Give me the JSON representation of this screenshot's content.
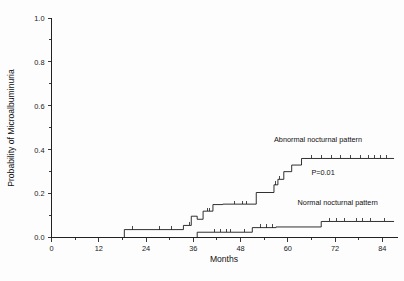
{
  "chart_data": {
    "type": "line",
    "title": "",
    "xlabel": "Months",
    "ylabel": "Probability of Microalbuminuria",
    "xlim": [
      0,
      88
    ],
    "ylim": [
      0,
      1.0
    ],
    "grid": false,
    "legend_position": "inline-above-curve",
    "x_ticks": [
      0,
      12,
      24,
      36,
      48,
      60,
      72,
      84
    ],
    "x_tick_labels": [
      "0",
      "12",
      "24",
      "36",
      "48",
      "60",
      "72",
      "84"
    ],
    "x_minor_ticks": [
      6,
      18,
      30,
      42,
      54,
      66,
      78
    ],
    "y_ticks": [
      0.0,
      0.2,
      0.4,
      0.6,
      0.8,
      1.0
    ],
    "y_tick_labels": [
      "0.0",
      "0.2",
      "0.4",
      "0.6",
      "0.8",
      "1.0"
    ],
    "y_minor_ticks": [
      0.1,
      0.3,
      0.5,
      0.7,
      0.9
    ],
    "annotations": [
      {
        "name": "p-value",
        "text": "P=0.01",
        "x": 66.0,
        "y": 0.285
      }
    ],
    "series": [
      {
        "name": "Abnormal nocturnal pattern",
        "label": "Abnormal nocturnal pattern",
        "label_x": 56.5,
        "label_y": 0.435,
        "steps": [
          [
            18.5,
            0.0
          ],
          [
            18.5,
            0.036
          ],
          [
            33.5,
            0.036
          ],
          [
            33.5,
            0.055
          ],
          [
            35.5,
            0.055
          ],
          [
            35.5,
            0.097
          ],
          [
            37.0,
            0.097
          ],
          [
            37.0,
            0.083
          ],
          [
            38.5,
            0.083
          ],
          [
            38.5,
            0.12
          ],
          [
            41.0,
            0.12
          ],
          [
            41.0,
            0.15
          ],
          [
            43.5,
            0.15
          ],
          [
            43.5,
            0.152
          ],
          [
            52.0,
            0.152
          ],
          [
            52.0,
            0.205
          ],
          [
            56.5,
            0.205
          ],
          [
            56.5,
            0.24
          ],
          [
            57.5,
            0.24
          ],
          [
            57.5,
            0.265
          ],
          [
            59.0,
            0.265
          ],
          [
            59.0,
            0.3
          ],
          [
            61.0,
            0.3
          ],
          [
            61.0,
            0.33
          ],
          [
            63.5,
            0.33
          ],
          [
            63.5,
            0.36
          ],
          [
            87.0,
            0.36
          ]
        ],
        "censor_points": [
          [
            20.5,
            0.036
          ],
          [
            27.5,
            0.036
          ],
          [
            30.5,
            0.036
          ],
          [
            35.0,
            0.055
          ],
          [
            39.5,
            0.12
          ],
          [
            40.0,
            0.12
          ],
          [
            46.5,
            0.152
          ],
          [
            48.5,
            0.152
          ],
          [
            49.5,
            0.152
          ],
          [
            57.0,
            0.24
          ],
          [
            58.0,
            0.265
          ],
          [
            66.0,
            0.36
          ],
          [
            68.5,
            0.36
          ],
          [
            71.0,
            0.36
          ],
          [
            73.5,
            0.36
          ],
          [
            76.0,
            0.36
          ],
          [
            78.5,
            0.36
          ],
          [
            80.5,
            0.36
          ],
          [
            82.0,
            0.36
          ],
          [
            83.5,
            0.36
          ],
          [
            85.0,
            0.36
          ]
        ]
      },
      {
        "name": "Normal nocturnal pattern",
        "label": "Normal nocturnal pattern",
        "label_x": 62.5,
        "label_y": 0.148,
        "steps": [
          [
            37.0,
            0.0
          ],
          [
            37.0,
            0.024
          ],
          [
            51.0,
            0.024
          ],
          [
            51.0,
            0.045
          ],
          [
            57.0,
            0.045
          ],
          [
            57.0,
            0.048
          ],
          [
            68.5,
            0.048
          ],
          [
            68.5,
            0.073
          ],
          [
            87.0,
            0.073
          ]
        ],
        "censor_points": [
          [
            41.5,
            0.024
          ],
          [
            43.0,
            0.024
          ],
          [
            44.5,
            0.024
          ],
          [
            45.5,
            0.024
          ],
          [
            49.0,
            0.024
          ],
          [
            53.0,
            0.045
          ],
          [
            54.5,
            0.045
          ],
          [
            56.0,
            0.045
          ],
          [
            70.5,
            0.073
          ],
          [
            72.5,
            0.073
          ],
          [
            74.5,
            0.073
          ],
          [
            77.5,
            0.073
          ],
          [
            79.0,
            0.073
          ],
          [
            81.0,
            0.073
          ],
          [
            84.5,
            0.073
          ]
        ]
      }
    ]
  }
}
